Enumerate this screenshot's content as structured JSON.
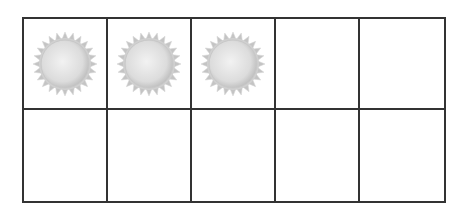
{
  "ten_frame": {
    "rows": 2,
    "columns": 5,
    "filled_count": 3,
    "counter_icon": "sun-icon",
    "colors": {
      "grid_line": "#333333",
      "background": "#ffffff",
      "sun_center": "#f2f2f2",
      "sun_edge": "#b8b8b8",
      "sun_rays": "#c4c4c4"
    },
    "cells": [
      {
        "row": 1,
        "col": 1,
        "filled": true
      },
      {
        "row": 1,
        "col": 2,
        "filled": true
      },
      {
        "row": 1,
        "col": 3,
        "filled": true
      },
      {
        "row": 1,
        "col": 4,
        "filled": false
      },
      {
        "row": 1,
        "col": 5,
        "filled": false
      },
      {
        "row": 2,
        "col": 1,
        "filled": false
      },
      {
        "row": 2,
        "col": 2,
        "filled": false
      },
      {
        "row": 2,
        "col": 3,
        "filled": false
      },
      {
        "row": 2,
        "col": 4,
        "filled": false
      },
      {
        "row": 2,
        "col": 5,
        "filled": false
      }
    ]
  }
}
